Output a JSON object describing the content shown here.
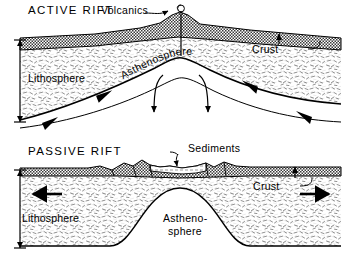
{
  "figure": {
    "type": "geological-cross-section-diagram",
    "style": "black-and-white line drawing",
    "panel_count": 2
  },
  "panels": [
    {
      "id": "active-rift",
      "title": "ACTIVE RIFT",
      "labels": {
        "volcanics": "Volcanics",
        "crust": "Crust",
        "lithosphere": "Lithosphere",
        "asthenosphere": "Asthenosphere"
      },
      "features": [
        "volcanic vent with eruption plume at rift axis",
        "domed asthenosphere ridge beneath rift",
        "upwelling convection arrows diverging outward",
        "thinned crust over rift crest",
        "lithosphere thickness scale bar at left"
      ]
    },
    {
      "id": "passive-rift",
      "title": "PASSIVE RIFT",
      "labels": {
        "sediments": "Sediments",
        "crust": "Crust",
        "lithosphere": "Lithosphere",
        "asthenosphere_line1": "Astheno-",
        "asthenosphere_line2": "sphere"
      },
      "features": [
        "faulted horst and graben blocks in crust",
        "sediment-filled basin between fault blocks",
        "bell-shaped asthenosphere dome",
        "bold horizontal extension arrows pointing outward",
        "lithosphere thickness scale bar at left"
      ]
    }
  ],
  "colors": {
    "ink": "#000000",
    "background": "#ffffff",
    "crust_fill": "#7a7a7a",
    "lithosphere_stipple": "#8d8d8d"
  }
}
